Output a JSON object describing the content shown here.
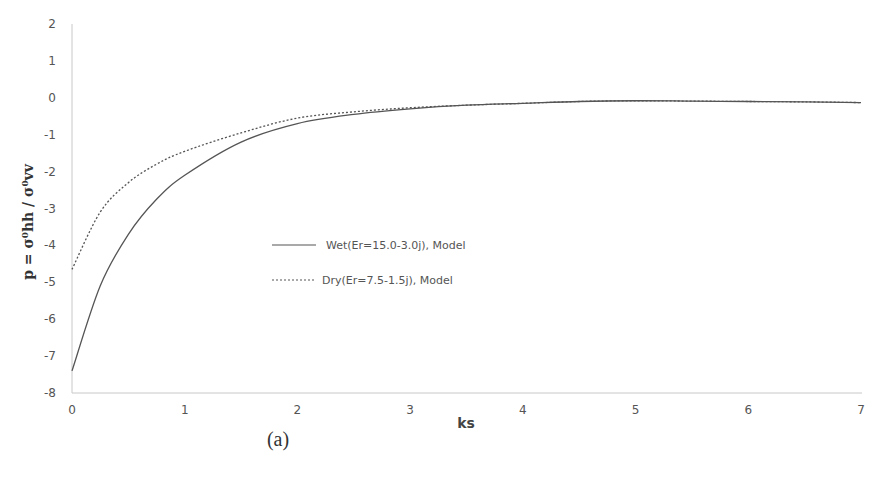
{
  "chart_data": {
    "type": "line",
    "title": "",
    "xlabel": "ks",
    "ylabel": "p = σ⁰hh / σ⁰vv",
    "xlim": [
      0,
      7
    ],
    "ylim": [
      -8,
      2
    ],
    "x_ticks": [
      "0",
      "1",
      "2",
      "3",
      "4",
      "5",
      "6",
      "7"
    ],
    "y_ticks": [
      "2",
      "1",
      "0",
      "-1",
      "-2",
      "-3",
      "-4",
      "-5",
      "-6",
      "-7",
      "-8"
    ],
    "grid": false,
    "legend_position": "inside-center-left",
    "x": [
      0,
      0.25,
      0.5,
      0.75,
      1,
      1.5,
      2,
      2.5,
      3,
      3.5,
      4,
      4.5,
      5,
      5.5,
      6,
      6.5,
      7
    ],
    "series": [
      {
        "name": "Wet(Er=15.0-3.0j), Model",
        "style": "solid",
        "values": [
          -7.4,
          -5.1,
          -3.7,
          -2.75,
          -2.1,
          -1.2,
          -0.7,
          -0.45,
          -0.3,
          -0.2,
          -0.15,
          -0.1,
          -0.08,
          -0.09,
          -0.1,
          -0.11,
          -0.13
        ]
      },
      {
        "name": "Dry(Er=7.5-1.5j), Model",
        "style": "dashed",
        "values": [
          -4.65,
          -3.1,
          -2.3,
          -1.8,
          -1.45,
          -0.95,
          -0.55,
          -0.38,
          -0.27,
          -0.2,
          -0.15,
          -0.1,
          -0.08,
          -0.09,
          -0.1,
          -0.11,
          -0.13
        ]
      }
    ],
    "caption": "(a)"
  },
  "legend": {
    "wet_label": "Wet(Er=15.0-3.0j), Model",
    "dry_label": "Dry(Er=7.5-1.5j), Model"
  },
  "axes": {
    "xlabel": "ks",
    "ylabel_main": "p = σ",
    "ylabel_full": "p = σ⁰hh / σ⁰vv"
  },
  "caption": "(a)",
  "colors": {
    "line": "#555555",
    "axis": "#bbbbbb",
    "text": "#555555"
  }
}
